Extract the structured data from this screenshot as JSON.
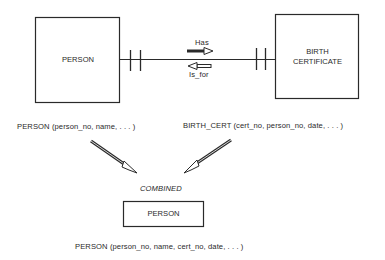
{
  "entities": {
    "person": {
      "label": "PERSON"
    },
    "birth_certificate": {
      "label_line1": "BIRTH",
      "label_line2": "CERTIFICATE"
    }
  },
  "relationship": {
    "forward_label": "Has",
    "reverse_label": "Is_for",
    "cardinality": "one-to-one"
  },
  "relations": {
    "person": "PERSON (person_no,  name, . . . )",
    "birth_cert": "BIRTH_CERT (cert_no,  person_no,  date,  . . . )"
  },
  "merge": {
    "label": "COMBINED",
    "result_entity": "PERSON",
    "result_relation": "PERSON (person_no,  name,  cert_no,  date, . . . )"
  },
  "colors": {
    "line": "#2a2a2a",
    "background": "#ffffff"
  }
}
